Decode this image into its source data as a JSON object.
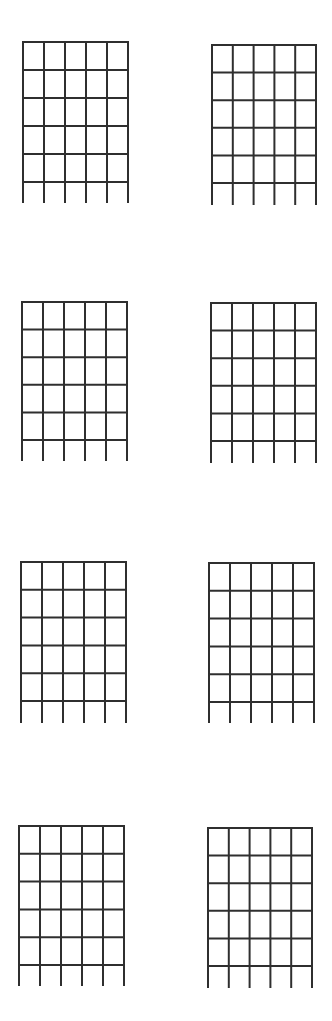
{
  "sheet": {
    "title": "",
    "line_color": "#2f2f2f",
    "background": "#ffffff",
    "strings_per_diagram": 6,
    "fret_lines_per_diagram": 6,
    "diagrams": [
      {
        "id": 1,
        "left": 23,
        "top": 42,
        "width": 105,
        "fret_bottom": 182,
        "string_bottom": 202
      },
      {
        "id": 2,
        "left": 212,
        "top": 45,
        "width": 104,
        "fret_bottom": 183,
        "string_bottom": 204
      },
      {
        "id": 3,
        "left": 22,
        "top": 302,
        "width": 105,
        "fret_bottom": 440,
        "string_bottom": 460
      },
      {
        "id": 4,
        "left": 211,
        "top": 303,
        "width": 105,
        "fret_bottom": 441,
        "string_bottom": 462
      },
      {
        "id": 5,
        "left": 21,
        "top": 562,
        "width": 105,
        "fret_bottom": 701,
        "string_bottom": 722
      },
      {
        "id": 6,
        "left": 209,
        "top": 563,
        "width": 105,
        "fret_bottom": 702,
        "string_bottom": 722
      },
      {
        "id": 7,
        "left": 19,
        "top": 826,
        "width": 105,
        "fret_bottom": 965,
        "string_bottom": 985
      },
      {
        "id": 8,
        "left": 208,
        "top": 828,
        "width": 104,
        "fret_bottom": 966,
        "string_bottom": 987
      }
    ]
  }
}
